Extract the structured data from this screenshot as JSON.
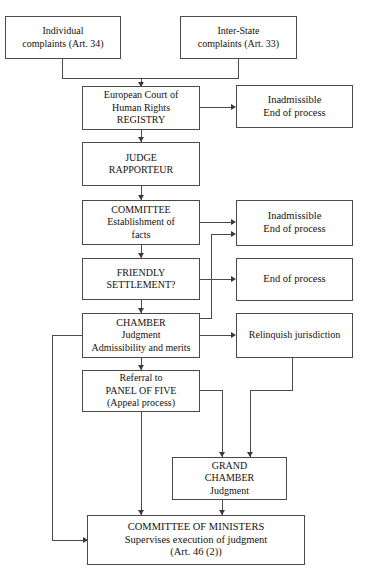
{
  "diagram": {
    "type": "flowchart",
    "colors": {
      "background": "#ffffff",
      "box_border": "#4a4a4a",
      "connector": "#4a4a4a",
      "text": "#15120f"
    },
    "nodes": [
      {
        "id": "individual-complaints",
        "lines": [
          "Individual",
          "complaints (Art. 34)"
        ]
      },
      {
        "id": "inter-state-complaints",
        "lines": [
          "Inter-State",
          "complaints (Art. 33)"
        ]
      },
      {
        "id": "registry",
        "lines": [
          "European Court of",
          "Human Rights",
          "REGISTRY"
        ]
      },
      {
        "id": "inadmissible-registry",
        "lines": [
          "Inadmissible",
          "End of process"
        ]
      },
      {
        "id": "judge-rapporteur",
        "lines": [
          "JUDGE",
          "RAPPORTEUR"
        ]
      },
      {
        "id": "committee",
        "lines": [
          "COMMITTEE",
          "Establishment of",
          "facts"
        ]
      },
      {
        "id": "inadmissible-committee",
        "lines": [
          "Inadmissible",
          "End of process"
        ]
      },
      {
        "id": "friendly-settlement",
        "lines": [
          "FRIENDLY",
          "SETTLEMENT?"
        ]
      },
      {
        "id": "end-of-process",
        "lines": [
          "End of process"
        ]
      },
      {
        "id": "chamber",
        "lines": [
          "CHAMBER",
          "Judgment",
          "Admissibility and merits"
        ]
      },
      {
        "id": "relinquish-jurisdiction",
        "lines": [
          "Relinquish jurisdiction"
        ]
      },
      {
        "id": "panel-of-five",
        "lines": [
          "Referral to",
          "PANEL OF FIVE",
          "(Appeal process)"
        ]
      },
      {
        "id": "grand-chamber",
        "lines": [
          "GRAND",
          "CHAMBER",
          "Judgment"
        ]
      },
      {
        "id": "committee-of-ministers",
        "lines": [
          "COMMITTEE OF MINISTERS",
          "Supervises execution of judgment",
          "(Art. 46 (2))"
        ]
      }
    ]
  }
}
